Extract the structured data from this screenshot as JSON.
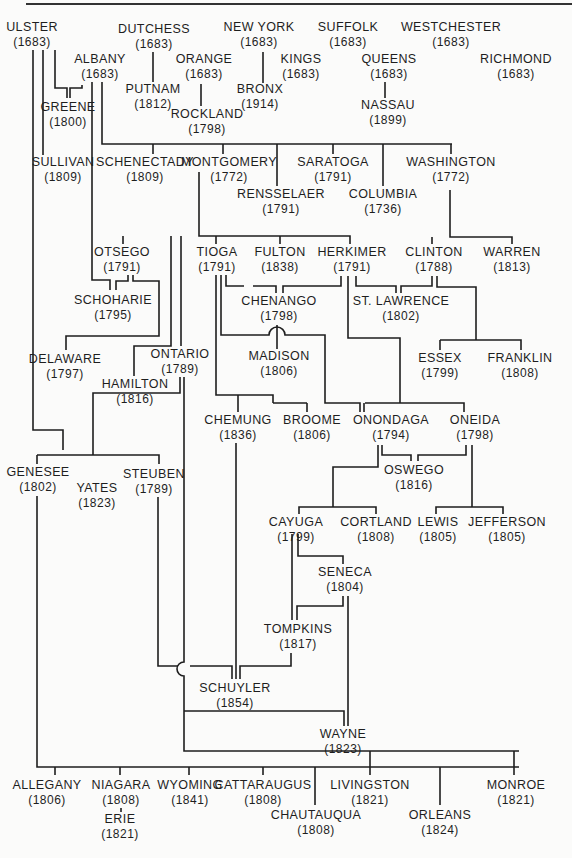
{
  "diagram": {
    "type": "genealogy of New York State counties (year formed)",
    "counties": [
      {
        "id": "ulster",
        "name": "ULSTER",
        "year": "(1683)",
        "x": 32,
        "y": 20
      },
      {
        "id": "dutchess",
        "name": "DUTCHESS",
        "year": "(1683)",
        "x": 154,
        "y": 22
      },
      {
        "id": "newyork",
        "name": "NEW YORK",
        "year": "(1683)",
        "x": 259,
        "y": 20
      },
      {
        "id": "suffolk",
        "name": "SUFFOLK",
        "year": "(1683)",
        "x": 348,
        "y": 20
      },
      {
        "id": "westchester",
        "name": "WESTCHESTER",
        "year": "(1683)",
        "x": 451,
        "y": 20
      },
      {
        "id": "albany",
        "name": "ALBANY",
        "year": "(1683)",
        "x": 100,
        "y": 52
      },
      {
        "id": "orange",
        "name": "ORANGE",
        "year": "(1683)",
        "x": 204,
        "y": 52
      },
      {
        "id": "kings",
        "name": "KINGS",
        "year": "(1683)",
        "x": 301,
        "y": 52
      },
      {
        "id": "queens",
        "name": "QUEENS",
        "year": "(1683)",
        "x": 389,
        "y": 52
      },
      {
        "id": "richmond",
        "name": "RICHMOND",
        "year": "(1683)",
        "x": 516,
        "y": 52
      },
      {
        "id": "putnam",
        "name": "PUTNAM",
        "year": "(1812)",
        "x": 153,
        "y": 82
      },
      {
        "id": "bronx",
        "name": "BRONX",
        "year": "(1914)",
        "x": 260,
        "y": 82
      },
      {
        "id": "nassau",
        "name": "NASSAU",
        "year": "(1899)",
        "x": 388,
        "y": 98
      },
      {
        "id": "greene",
        "name": "GREENE",
        "year": "(1800)",
        "x": 68,
        "y": 100
      },
      {
        "id": "rockland",
        "name": "ROCKLAND",
        "year": "(1798)",
        "x": 207,
        "y": 107
      },
      {
        "id": "sullivan",
        "name": "SULLIVAN",
        "year": "(1809)",
        "x": 63,
        "y": 155
      },
      {
        "id": "schenectady",
        "name": "SCHENECTADY",
        "year": "(1809)",
        "x": 145,
        "y": 155
      },
      {
        "id": "montgomery",
        "name": "MONTGOMERY",
        "year": "(1772)",
        "x": 229,
        "y": 155
      },
      {
        "id": "saratoga",
        "name": "SARATOGA",
        "year": "(1791)",
        "x": 333,
        "y": 155
      },
      {
        "id": "washington",
        "name": "WASHINGTON",
        "year": "(1772)",
        "x": 451,
        "y": 155
      },
      {
        "id": "rensselaer",
        "name": "RENSSELAER",
        "year": "(1791)",
        "x": 281,
        "y": 187
      },
      {
        "id": "columbia",
        "name": "COLUMBIA",
        "year": "(1736)",
        "x": 383,
        "y": 187
      },
      {
        "id": "otsego",
        "name": "OTSEGO",
        "year": "(1791)",
        "x": 122,
        "y": 245
      },
      {
        "id": "tioga",
        "name": "TIOGA",
        "year": "(1791)",
        "x": 217,
        "y": 245
      },
      {
        "id": "fulton",
        "name": "FULTON",
        "year": "(1838)",
        "x": 280,
        "y": 245
      },
      {
        "id": "herkimer",
        "name": "HERKIMER",
        "year": "(1791)",
        "x": 352,
        "y": 245
      },
      {
        "id": "clinton",
        "name": "CLINTON",
        "year": "(1788)",
        "x": 434,
        "y": 245
      },
      {
        "id": "warren",
        "name": "WARREN",
        "year": "(1813)",
        "x": 512,
        "y": 245
      },
      {
        "id": "chenango",
        "name": "CHENANGO",
        "year": "(1798)",
        "x": 279,
        "y": 294
      },
      {
        "id": "schoharie",
        "name": "SCHOHARIE",
        "year": "(1795)",
        "x": 113,
        "y": 293
      },
      {
        "id": "stlawrence",
        "name": "ST. LAWRENCE",
        "year": "(1802)",
        "x": 401,
        "y": 294
      },
      {
        "id": "madison",
        "name": "MADISON",
        "year": "(1806)",
        "x": 279,
        "y": 349
      },
      {
        "id": "essex",
        "name": "ESSEX",
        "year": "(1799)",
        "x": 440,
        "y": 351
      },
      {
        "id": "franklin",
        "name": "FRANKLIN",
        "year": "(1808)",
        "x": 520,
        "y": 351
      },
      {
        "id": "delaware",
        "name": "DELAWARE",
        "year": "(1797)",
        "x": 65,
        "y": 352
      },
      {
        "id": "ontario",
        "name": "ONTARIO",
        "year": "(1789)",
        "x": 180,
        "y": 347
      },
      {
        "id": "hamilton",
        "name": "HAMILTON",
        "year": "(1816)",
        "x": 135,
        "y": 377
      },
      {
        "id": "chemung",
        "name": "CHEMUNG",
        "year": "(1836)",
        "x": 238,
        "y": 413
      },
      {
        "id": "broome",
        "name": "BROOME",
        "year": "(1806)",
        "x": 312,
        "y": 413
      },
      {
        "id": "onondaga",
        "name": "ONONDAGA",
        "year": "(1794)",
        "x": 391,
        "y": 413
      },
      {
        "id": "oneida",
        "name": "ONEIDA",
        "year": "(1798)",
        "x": 475,
        "y": 413
      },
      {
        "id": "oswego",
        "name": "OSWEGO",
        "year": "(1816)",
        "x": 414,
        "y": 463
      },
      {
        "id": "genesee",
        "name": "GENESEE",
        "year": "(1802)",
        "x": 38,
        "y": 465
      },
      {
        "id": "steuben",
        "name": "STEUBEN",
        "year": "(1789)",
        "x": 154,
        "y": 467
      },
      {
        "id": "yates",
        "name": "YATES",
        "year": "(1823)",
        "x": 97,
        "y": 481
      },
      {
        "id": "cayuga",
        "name": "CAYUGA",
        "year": "(1799)",
        "x": 296,
        "y": 515
      },
      {
        "id": "cortland",
        "name": "CORTLAND",
        "year": "(1808)",
        "x": 376,
        "y": 515
      },
      {
        "id": "lewis",
        "name": "LEWIS",
        "year": "(1805)",
        "x": 438,
        "y": 515
      },
      {
        "id": "jefferson",
        "name": "JEFFERSON",
        "year": "(1805)",
        "x": 507,
        "y": 515
      },
      {
        "id": "seneca",
        "name": "SENECA",
        "year": "(1804)",
        "x": 345,
        "y": 565
      },
      {
        "id": "tompkins",
        "name": "TOMPKINS",
        "year": "(1817)",
        "x": 298,
        "y": 622
      },
      {
        "id": "schuyler",
        "name": "SCHUYLER",
        "year": "(1854)",
        "x": 235,
        "y": 681
      },
      {
        "id": "wayne",
        "name": "WAYNE",
        "year": "(1823)",
        "x": 343,
        "y": 727
      },
      {
        "id": "allegany",
        "name": "ALLEGANY",
        "year": "(1806)",
        "x": 47,
        "y": 778
      },
      {
        "id": "niagara",
        "name": "NIAGARA",
        "year": "(1808)",
        "x": 121,
        "y": 778
      },
      {
        "id": "wyoming",
        "name": "WYOMING",
        "year": "(1841)",
        "x": 190,
        "y": 778
      },
      {
        "id": "cattaraugus",
        "name": "CATTARAUGUS",
        "year": "(1808)",
        "x": 263,
        "y": 778
      },
      {
        "id": "livingston",
        "name": "LIVINGSTON",
        "year": "(1821)",
        "x": 370,
        "y": 778
      },
      {
        "id": "monroe",
        "name": "MONROE",
        "year": "(1821)",
        "x": 516,
        "y": 778
      },
      {
        "id": "erie",
        "name": "ERIE",
        "year": "(1821)",
        "x": 120,
        "y": 812
      },
      {
        "id": "chautauqua",
        "name": "CHAUTAUQUA",
        "year": "(1808)",
        "x": 316,
        "y": 808
      },
      {
        "id": "orleans",
        "name": "ORLEANS",
        "year": "(1824)",
        "x": 440,
        "y": 808
      }
    ],
    "relations": [
      {
        "parent": "ULSTER",
        "children": [
          "GREENE",
          "SULLIVAN",
          "DELAWARE"
        ]
      },
      {
        "parent": "ALBANY",
        "children": [
          "GREENE",
          "SCHENECTADY",
          "MONTGOMERY",
          "SARATOGA",
          "RENSSELAER",
          "COLUMBIA",
          "WASHINGTON",
          "SCHOHARIE"
        ]
      },
      {
        "parent": "DUTCHESS",
        "children": [
          "PUTNAM"
        ]
      },
      {
        "parent": "ORANGE",
        "children": [
          "ROCKLAND"
        ]
      },
      {
        "parent": "NEW YORK",
        "children": [
          "BRONX"
        ]
      },
      {
        "parent": "QUEENS",
        "children": [
          "NASSAU"
        ]
      },
      {
        "parent": "MONTGOMERY",
        "children": [
          "OTSEGO",
          "TIOGA",
          "FULTON",
          "HERKIMER",
          "ONTARIO",
          "HAMILTON"
        ]
      },
      {
        "parent": "OTSEGO",
        "children": [
          "SCHOHARIE",
          "DELAWARE"
        ]
      },
      {
        "parent": "WASHINGTON",
        "children": [
          "CLINTON",
          "WARREN"
        ]
      },
      {
        "parent": "TIOGA",
        "children": [
          "CHENANGO",
          "CHEMUNG",
          "BROOME"
        ]
      },
      {
        "parent": "HERKIMER",
        "children": [
          "CHENANGO",
          "ST. LAWRENCE",
          "ONONDAGA",
          "ONEIDA"
        ]
      },
      {
        "parent": "CLINTON",
        "children": [
          "ST. LAWRENCE",
          "ESSEX",
          "FRANKLIN"
        ]
      },
      {
        "parent": "CHENANGO",
        "children": [
          "MADISON"
        ]
      },
      {
        "parent": "ONTARIO",
        "children": [
          "GENESEE",
          "YATES",
          "STEUBEN",
          "WAYNE",
          "LIVINGSTON",
          "MONROE"
        ]
      },
      {
        "parent": "ONONDAGA",
        "children": [
          "OSWEGO",
          "CAYUGA",
          "CORTLAND"
        ]
      },
      {
        "parent": "ONEIDA",
        "children": [
          "OSWEGO",
          "LEWIS",
          "JEFFERSON"
        ]
      },
      {
        "parent": "CAYUGA",
        "children": [
          "SENECA",
          "TOMPKINS",
          "WAYNE"
        ]
      },
      {
        "parent": "SENECA",
        "children": [
          "TOMPKINS"
        ]
      },
      {
        "parent": "STEUBEN",
        "children": [
          "SCHUYLER"
        ]
      },
      {
        "parent": "CHEMUNG",
        "children": [
          "SCHUYLER"
        ]
      },
      {
        "parent": "TOMPKINS",
        "children": [
          "SCHUYLER"
        ]
      },
      {
        "parent": "GENESEE",
        "children": [
          "ALLEGANY",
          "NIAGARA",
          "WYOMING",
          "CATTARAUGUS",
          "CHAUTAUQUA",
          "LIVINGSTON",
          "ORLEANS",
          "MONROE"
        ]
      },
      {
        "parent": "NIAGARA",
        "children": [
          "ERIE"
        ]
      }
    ]
  }
}
